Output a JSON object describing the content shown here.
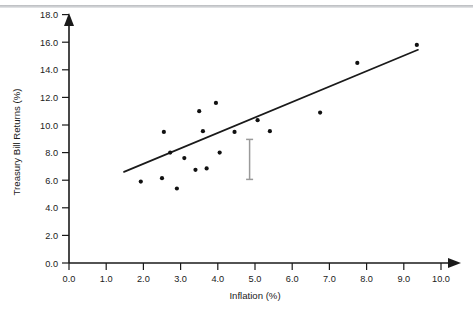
{
  "figure": {
    "background_color": "#ffffff",
    "top_rule_color": "#c3c5c8"
  },
  "chart_data": {
    "type": "scatter",
    "title": "",
    "subtitle": "",
    "xlabel": "Inflation (%)",
    "ylabel": "Treasury Bill Returns (%)",
    "xlim": [
      0.0,
      10.0
    ],
    "ylim": [
      0.0,
      18.0
    ],
    "xticks": [
      0.0,
      1.0,
      2.0,
      3.0,
      4.0,
      5.0,
      6.0,
      7.0,
      8.0,
      9.0,
      10.0
    ],
    "yticks": [
      0.0,
      2.0,
      4.0,
      6.0,
      8.0,
      10.0,
      12.0,
      14.0,
      16.0,
      18.0
    ],
    "xtick_labels": [
      "0.0",
      "1.0",
      "2.0",
      "3.0",
      "4.0",
      "5.0",
      "6.0",
      "7.0",
      "8.0",
      "9.0",
      "10.0"
    ],
    "ytick_labels": [
      "0.0",
      "2.0",
      "4.0",
      "6.0",
      "8.0",
      "10.0",
      "12.0",
      "14.0",
      "16.0",
      "18.0"
    ],
    "grid": false,
    "legend": false,
    "legend_position": "none",
    "axis_style": "arrow-tipped-l-frame",
    "marker_color": "#111111",
    "marker_size": 2.1,
    "series": [
      {
        "name": "Observations",
        "type": "scatter",
        "points": [
          {
            "x": 1.93,
            "y": 5.9
          },
          {
            "x": 2.5,
            "y": 6.15
          },
          {
            "x": 2.55,
            "y": 9.5
          },
          {
            "x": 2.72,
            "y": 8.0
          },
          {
            "x": 2.9,
            "y": 5.4
          },
          {
            "x": 3.1,
            "y": 7.6
          },
          {
            "x": 3.4,
            "y": 6.75
          },
          {
            "x": 3.5,
            "y": 11.0
          },
          {
            "x": 3.6,
            "y": 9.55
          },
          {
            "x": 3.7,
            "y": 6.85
          },
          {
            "x": 3.95,
            "y": 11.6
          },
          {
            "x": 4.05,
            "y": 8.0
          },
          {
            "x": 4.45,
            "y": 9.5
          },
          {
            "x": 5.07,
            "y": 10.35
          },
          {
            "x": 5.4,
            "y": 9.55
          },
          {
            "x": 6.75,
            "y": 10.9
          },
          {
            "x": 7.75,
            "y": 14.5
          },
          {
            "x": 9.35,
            "y": 15.8
          }
        ]
      }
    ],
    "trendline": {
      "name": "Fitted regression line",
      "color": "#1a1a1a",
      "width": 1.7,
      "x_start": 1.48,
      "y_start": 6.6,
      "x_end": 9.38,
      "y_end": 15.45
    },
    "error_bar": {
      "name": "Confidence interval marker",
      "x": 5.07,
      "y_center": 10.35,
      "y_low": 8.95,
      "y_high": 11.85,
      "color": "#9a9a9a",
      "cap_width": 7
    }
  }
}
